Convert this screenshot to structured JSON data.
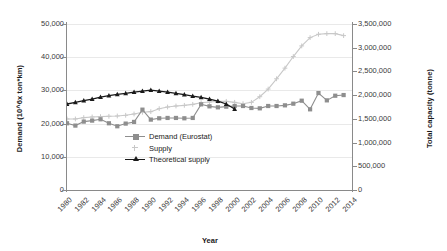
{
  "chart_data": {
    "type": "line",
    "title": "",
    "xlabel": "Year",
    "ylabel": "Demand (10^6x ton*km)",
    "ylabel_right": "Total capacity (tonne)",
    "grid": true,
    "legend_position": "inside-bottom-left",
    "xlim": [
      1980,
      2014
    ],
    "ylim": [
      0,
      50000
    ],
    "ylim_right": [
      0,
      3500000
    ],
    "x": [
      1980,
      1981,
      1982,
      1983,
      1984,
      1985,
      1986,
      1987,
      1988,
      1989,
      1990,
      1991,
      1992,
      1993,
      1994,
      1995,
      1996,
      1997,
      1998,
      1999,
      2000,
      2001,
      2002,
      2003,
      2004,
      2005,
      2006,
      2007,
      2008,
      2009,
      2010,
      2011,
      2012,
      2013
    ],
    "xticks": [
      "1980",
      "1982",
      "1984",
      "1986",
      "1988",
      "1990",
      "1992",
      "1994",
      "1996",
      "1998",
      "2000",
      "2002",
      "2004",
      "2006",
      "2008",
      "2010",
      "2012",
      "2014"
    ],
    "yticks_left": [
      "0",
      "10,000",
      "20,000",
      "30,000",
      "40,000",
      "50,000"
    ],
    "yticks_right": [
      "0",
      "500,000",
      "1,000,000",
      "1,500,000",
      "2,000,000",
      "2,500,000",
      "3,000,000",
      "3,500,000"
    ],
    "series": [
      {
        "name": "Demand (Eurostat)",
        "color": "#8e8e8e",
        "marker": "square",
        "values": [
          20100,
          19400,
          20600,
          20900,
          21300,
          20100,
          19200,
          20000,
          20500,
          24200,
          21200,
          21600,
          21700,
          21700,
          21600,
          21700,
          25800,
          25200,
          24900,
          25100,
          25300,
          25300,
          24700,
          24600,
          25300,
          25300,
          25500,
          26000,
          26900,
          24300,
          29200,
          27000,
          28400,
          28600
        ]
      },
      {
        "name": "Supply",
        "color": "#c8c8c8",
        "marker": "plus",
        "values": [
          21400,
          21400,
          21800,
          22000,
          22100,
          22200,
          22300,
          22500,
          22900,
          23400,
          23600,
          24500,
          25000,
          25300,
          25500,
          25800,
          26300,
          26500,
          26700,
          26700,
          26400,
          26000,
          26400,
          28100,
          30400,
          33500,
          36700,
          40200,
          43400,
          45900,
          46900,
          47100,
          47100,
          46500
        ]
      },
      {
        "name": "Theoretical supply",
        "color": "#1a1a1a",
        "marker": "triangle",
        "values": [
          25900,
          26400,
          26900,
          27400,
          28000,
          28400,
          28800,
          29100,
          29500,
          29800,
          30100,
          29800,
          29500,
          29100,
          28700,
          28300,
          27900,
          27400,
          26800,
          25900,
          24400,
          null,
          null,
          null,
          null,
          null,
          null,
          null,
          null,
          null,
          null,
          null,
          null,
          null
        ],
        "note": "series ends mid-1990s"
      }
    ]
  }
}
